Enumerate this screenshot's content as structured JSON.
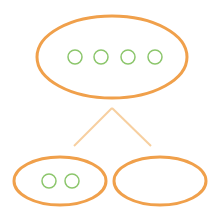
{
  "diagram": {
    "type": "tree",
    "colors": {
      "background": "#ffffff",
      "node_stroke": "#f0a04b",
      "edge_stroke": "#f7cf9f",
      "item_stroke": "#8cc66c"
    },
    "root": {
      "id": "root",
      "shape": "ellipse",
      "cx": 112,
      "cy": 57,
      "rx": 75,
      "ry": 41,
      "items": [
        {
          "cx": 75,
          "cy": 57,
          "r": 7
        },
        {
          "cx": 101,
          "cy": 57,
          "r": 7
        },
        {
          "cx": 128,
          "cy": 57,
          "r": 7
        },
        {
          "cx": 155,
          "cy": 57,
          "r": 7
        }
      ]
    },
    "edges": [
      {
        "x1": 112,
        "y1": 108,
        "x2": 74,
        "y2": 146
      },
      {
        "x1": 112,
        "y1": 108,
        "x2": 151,
        "y2": 146
      }
    ],
    "children": [
      {
        "id": "left-child",
        "shape": "ellipse",
        "cx": 60,
        "cy": 181,
        "rx": 46,
        "ry": 24,
        "items": [
          {
            "cx": 49,
            "cy": 181,
            "r": 7
          },
          {
            "cx": 72,
            "cy": 181,
            "r": 7
          }
        ]
      },
      {
        "id": "right-child",
        "shape": "ellipse",
        "cx": 160,
        "cy": 181,
        "rx": 46,
        "ry": 24,
        "items": []
      }
    ]
  }
}
